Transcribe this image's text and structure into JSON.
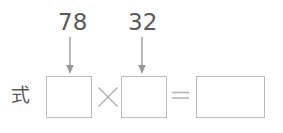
{
  "worksheet": {
    "row_label": "式",
    "annotations": [
      {
        "id": "first-factor",
        "value": "78"
      },
      {
        "id": "second-factor",
        "value": "32"
      }
    ],
    "equation": {
      "multiplicand_box_value": "",
      "operator_times": "×",
      "multiplier_box_value": "",
      "operator_equals": "=",
      "product_box_value": ""
    },
    "icons": {
      "arrow_first": "arrow-down-icon",
      "arrow_second": "arrow-down-icon"
    },
    "colors": {
      "background": "#ffffff",
      "ink": "#5a5a5a",
      "box_border": "#bcbcbc",
      "operator": "#b5b5b5",
      "arrow": "#9a9a9a"
    }
  }
}
